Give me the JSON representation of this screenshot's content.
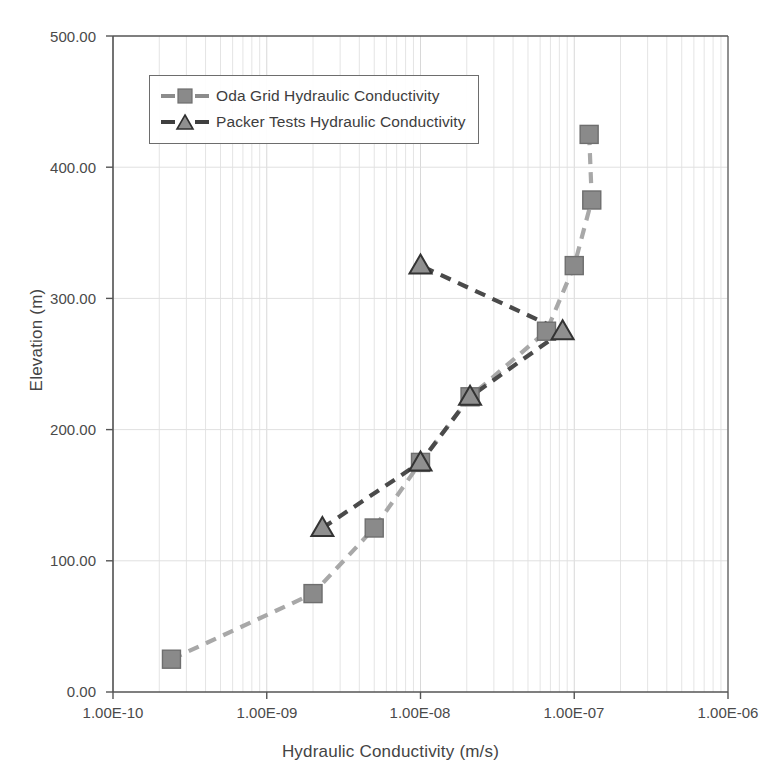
{
  "chart_data": {
    "type": "scatter",
    "title": "",
    "xlabel": "Hydraulic Conductivity (m/s)",
    "ylabel": "Elevation (m)",
    "xscale": "log",
    "yscale": "linear",
    "xlim": [
      1e-10,
      1e-06
    ],
    "ylim": [
      0,
      500
    ],
    "grid": true,
    "legend_position": "upper-left-inside",
    "xticks": [
      "1.00E-10",
      "1.00E-09",
      "1.00E-08",
      "1.00E-07",
      "1.00E-06"
    ],
    "xtick_values": [
      1e-10,
      1e-09,
      1e-08,
      1e-07,
      1e-06
    ],
    "yticks": [
      "0.00",
      "100.00",
      "200.00",
      "300.00",
      "400.00",
      "500.00"
    ],
    "ytick_values": [
      0,
      100,
      200,
      300,
      400,
      500
    ],
    "series": [
      {
        "name": "Oda Grid Hydraulic Conductivity",
        "marker": "square",
        "marker_color": "#8a8a8a",
        "marker_edge_color": "#6e6e6e",
        "line_color": "#a8a8a8",
        "line_style": "dashed",
        "points": [
          {
            "x": 2.4e-10,
            "y": 25
          },
          {
            "x": 2e-09,
            "y": 75
          },
          {
            "x": 5e-09,
            "y": 125
          },
          {
            "x": 1e-08,
            "y": 175
          },
          {
            "x": 2.1e-08,
            "y": 225
          },
          {
            "x": 6.6e-08,
            "y": 275
          },
          {
            "x": 1e-07,
            "y": 325
          },
          {
            "x": 1.3e-07,
            "y": 375
          },
          {
            "x": 1.25e-07,
            "y": 425
          }
        ]
      },
      {
        "name": "Packer Tests Hydraulic Conductivity",
        "marker": "triangle",
        "marker_color": "#8f8f8f",
        "marker_edge_color": "#333333",
        "line_color": "#4a4a4a",
        "line_style": "dashed",
        "points": [
          {
            "x": 2.3e-09,
            "y": 125
          },
          {
            "x": 1e-08,
            "y": 175
          },
          {
            "x": 2.1e-08,
            "y": 225
          },
          {
            "x": 8.4e-08,
            "y": 275
          },
          {
            "x": 1e-08,
            "y": 325
          }
        ]
      }
    ]
  },
  "legend": {
    "entries": [
      {
        "label": "Oda Grid Hydraulic Conductivity"
      },
      {
        "label": "Packer Tests Hydraulic Conductivity"
      }
    ]
  },
  "colors": {
    "oda_marker": "#8a8a8a",
    "oda_line": "#a8a8a8",
    "packer_marker": "#8f8f8f",
    "packer_line": "#4a4a4a",
    "axis": "#555555",
    "grid": "#e4e4e4"
  }
}
